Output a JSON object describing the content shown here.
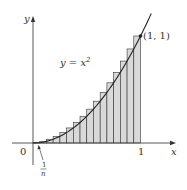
{
  "diagram": {
    "curve_label": "y = x",
    "curve_exponent": "2",
    "point_label": "(1, 1)",
    "axis_x_label": "x",
    "axis_y_label": "y",
    "origin_label": "0",
    "tick_one_label": "1",
    "width_label_num": "1",
    "width_label_den": "n",
    "colors": {
      "axis": "#444444",
      "curve": "#222222",
      "rect_fill": "#d9d9d9",
      "rect_stroke": "#333333"
    }
  },
  "chart_data": {
    "type": "area",
    "function": "x^2",
    "n_rectangles": 16,
    "x_range": [
      0,
      1
    ],
    "y_range": [
      0,
      1
    ],
    "rect_heights": [
      0.0039,
      0.0156,
      0.0352,
      0.0625,
      0.0977,
      0.1406,
      0.1914,
      0.25,
      0.3164,
      0.3906,
      0.4727,
      0.5625,
      0.6602,
      0.7656,
      0.8789,
      1.0
    ],
    "annotations": [
      "y = x^2",
      "(1, 1)",
      "1/n"
    ],
    "xlabel": "x",
    "ylabel": "y"
  }
}
